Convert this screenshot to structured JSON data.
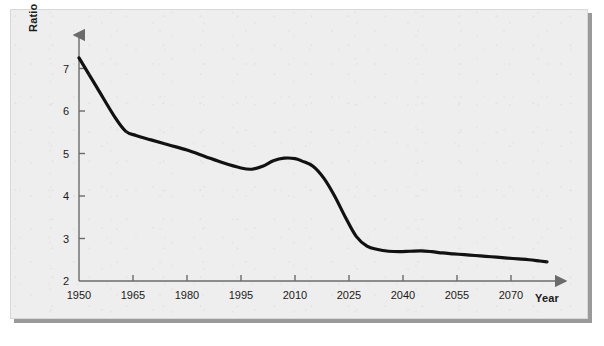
{
  "figure": {
    "background_color": "#eeeeee",
    "line_color": "#111111",
    "axis_color": "#6b6b6b"
  },
  "labels": {
    "y_axis_title": "Ratio",
    "x_axis_title": "Year"
  },
  "chart_data": {
    "type": "line",
    "title": "",
    "xlabel": "Year",
    "ylabel": "Ratio",
    "xlim": [
      1950,
      2080
    ],
    "ylim": [
      2,
      7.6
    ],
    "grid": false,
    "legend": null,
    "xticks": [
      1950,
      1965,
      1980,
      1995,
      2010,
      2025,
      2040,
      2055,
      2070
    ],
    "xtick_labels": [
      "1950",
      "1965",
      "1980",
      "1995",
      "2010",
      "2025",
      "2040",
      "2055",
      "2070"
    ],
    "yticks": [
      2,
      3,
      4,
      5,
      6,
      7
    ],
    "ytick_labels": [
      "2",
      "3",
      "4",
      "5",
      "6",
      "7"
    ],
    "series": [
      {
        "name": "Ratio",
        "x": [
          1950,
          1955,
          1960,
          1963,
          1966,
          1970,
          1975,
          1980,
          1985,
          1990,
          1995,
          1998,
          2001,
          2004,
          2007,
          2010,
          2012,
          2015,
          2018,
          2021,
          2024,
          2027,
          2030,
          2033,
          2036,
          2039,
          2042,
          2045,
          2048,
          2051,
          2054,
          2057,
          2060,
          2063,
          2066,
          2069,
          2072,
          2075,
          2078,
          2080
        ],
        "y": [
          7.25,
          6.55,
          5.85,
          5.52,
          5.42,
          5.32,
          5.2,
          5.08,
          4.93,
          4.78,
          4.66,
          4.63,
          4.7,
          4.83,
          4.89,
          4.88,
          4.82,
          4.7,
          4.42,
          4.0,
          3.5,
          3.05,
          2.82,
          2.74,
          2.7,
          2.69,
          2.7,
          2.71,
          2.69,
          2.66,
          2.64,
          2.62,
          2.6,
          2.58,
          2.56,
          2.54,
          2.52,
          2.5,
          2.47,
          2.45
        ]
      }
    ]
  }
}
